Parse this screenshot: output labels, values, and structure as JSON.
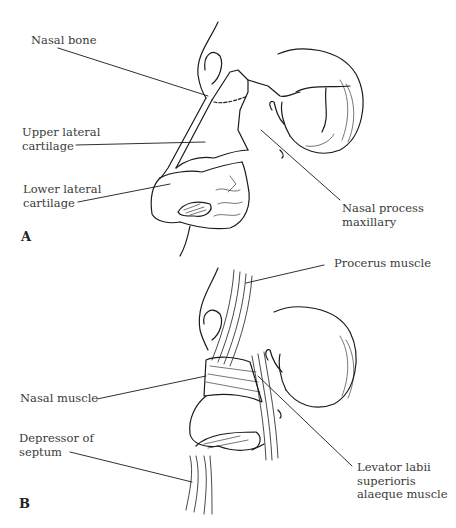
{
  "figure": {
    "panels": [
      {
        "id": "A",
        "letter": "A",
        "labels": [
          {
            "key": "nasal_bone",
            "lines": [
              "Nasal bone"
            ]
          },
          {
            "key": "upper_lateral_cartilage",
            "lines": [
              "Upper lateral",
              "cartilage"
            ]
          },
          {
            "key": "lower_lateral_cartilage",
            "lines": [
              "Lower lateral",
              "cartilage"
            ]
          },
          {
            "key": "nasal_process_maxillary",
            "lines": [
              "Nasal process",
              "maxillary"
            ]
          }
        ]
      },
      {
        "id": "B",
        "letter": "B",
        "labels": [
          {
            "key": "procerus_muscle",
            "lines": [
              "Procerus muscle"
            ]
          },
          {
            "key": "nasal_muscle",
            "lines": [
              "Nasal muscle"
            ]
          },
          {
            "key": "depressor_of_septum",
            "lines": [
              "Depressor of",
              "septum"
            ]
          },
          {
            "key": "levator_labii",
            "lines": [
              "Levator labii",
              "superioris",
              "alaeque muscle"
            ]
          }
        ]
      }
    ]
  },
  "colors": {
    "line": "#1a1a1a",
    "text": "#3a3a3a",
    "background": "#ffffff"
  }
}
